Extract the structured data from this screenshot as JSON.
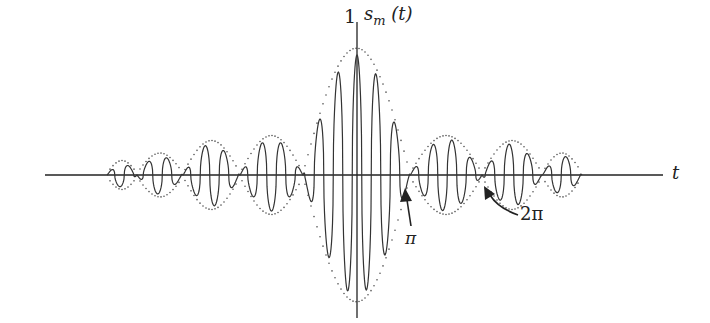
{
  "figure": {
    "y_axis_label": "s",
    "y_axis_label_sub": "m",
    "y_axis_label_arg": "(t)",
    "y_tick_label": "1",
    "x_axis_label": "t",
    "annotation_pi": "π",
    "annotation_2pi": "2π",
    "line_color": "#333333",
    "envelope_color": "#555555"
  },
  "chart_data": {
    "type": "line",
    "title": "",
    "xlabel": "t",
    "ylabel": "s_m(t)",
    "y_ticks": [
      1
    ],
    "annotations": [
      {
        "label": "π",
        "position": "first zero of envelope (right side)"
      },
      {
        "label": "2π",
        "position": "second zero of envelope (right side)"
      }
    ],
    "envelope_nulls_px_left": [
      303,
      240,
      183,
      137,
      107
    ],
    "envelope_nulls_px_right": [
      410,
      482,
      542,
      582
    ],
    "lobe_peak_amplitudes": {
      "main": 1.0,
      "side1": 0.3,
      "side2": 0.26,
      "side3": 0.16,
      "side4": 0.1
    },
    "center_px": 357,
    "axis_y_px": 175,
    "unit_amplitude_px": 120,
    "carrier_period_px": 19
  }
}
